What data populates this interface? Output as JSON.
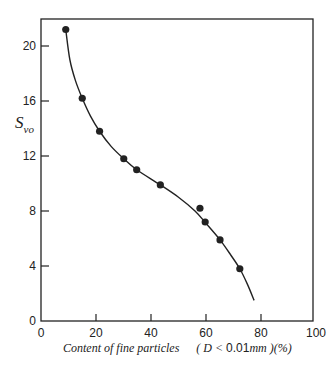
{
  "chart_data": {
    "type": "scatter",
    "title": "",
    "xlabel": "Content of fine particles (D < 0.01mm)(%)",
    "ylabel": "S_vo",
    "xlim": [
      0,
      100
    ],
    "ylim": [
      0,
      22
    ],
    "grid": false,
    "legend": null,
    "x_ticks": [
      0,
      20,
      40,
      60,
      80,
      100
    ],
    "y_ticks": [
      0,
      4,
      8,
      12,
      16,
      20
    ],
    "series": [
      {
        "name": "measured",
        "marker": "filled-circle",
        "points": [
          {
            "x": 9.0,
            "y": 21.2
          },
          {
            "x": 15.0,
            "y": 16.2
          },
          {
            "x": 21.3,
            "y": 13.8
          },
          {
            "x": 30.1,
            "y": 11.8
          },
          {
            "x": 34.8,
            "y": 11.0
          },
          {
            "x": 43.4,
            "y": 9.9
          },
          {
            "x": 57.8,
            "y": 8.2
          },
          {
            "x": 59.7,
            "y": 7.2
          },
          {
            "x": 65.1,
            "y": 5.9
          },
          {
            "x": 72.3,
            "y": 3.8
          }
        ]
      },
      {
        "name": "fitted curve",
        "marker": "line",
        "points": [
          {
            "x": 9.0,
            "y": 21.2
          },
          {
            "x": 10.5,
            "y": 19.0
          },
          {
            "x": 12.5,
            "y": 17.5
          },
          {
            "x": 15.0,
            "y": 16.2
          },
          {
            "x": 18.0,
            "y": 14.9
          },
          {
            "x": 21.3,
            "y": 13.8
          },
          {
            "x": 25.5,
            "y": 12.7
          },
          {
            "x": 30.1,
            "y": 11.8
          },
          {
            "x": 34.8,
            "y": 11.0
          },
          {
            "x": 43.4,
            "y": 9.9
          },
          {
            "x": 50.0,
            "y": 9.0
          },
          {
            "x": 56.0,
            "y": 8.0
          },
          {
            "x": 60.0,
            "y": 7.1
          },
          {
            "x": 65.1,
            "y": 5.9
          },
          {
            "x": 69.0,
            "y": 4.8
          },
          {
            "x": 72.3,
            "y": 3.8
          },
          {
            "x": 75.0,
            "y": 2.7
          },
          {
            "x": 77.5,
            "y": 1.5
          }
        ]
      }
    ]
  },
  "labels": {
    "ylabel_main": "S",
    "ylabel_sub": "vo",
    "xlabel_text": "Content of fine particles",
    "xlabel_paren_open": "( D <",
    "xlabel_value": "0.01",
    "xlabel_unit": "mm )(%)"
  },
  "colors": {
    "ink": "#222222",
    "background": "#ffffff"
  }
}
